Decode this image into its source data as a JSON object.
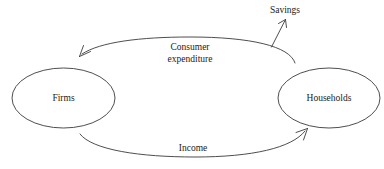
{
  "diagram": {
    "background_color": "#ffffff",
    "stroke_color": "#3a3a3a",
    "text_color": "#1a1a1a",
    "nodes": [
      {
        "id": "firms",
        "label": "Firms"
      },
      {
        "id": "households",
        "label": "Households"
      }
    ],
    "flows": [
      {
        "id": "consumer-expenditure",
        "label_line1": "Consumer",
        "label_line2": "expenditure",
        "from": "households",
        "to": "firms",
        "direction": "right-to-left"
      },
      {
        "id": "income",
        "label": "Income",
        "from": "firms",
        "to": "households",
        "direction": "left-to-right"
      },
      {
        "id": "savings",
        "label": "Savings",
        "from": "consumer-expenditure",
        "to": "leakage",
        "direction": "upward"
      }
    ]
  }
}
